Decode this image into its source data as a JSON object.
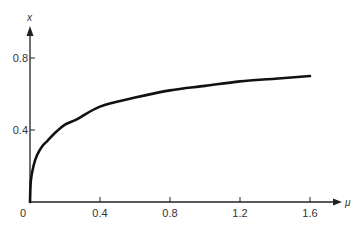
{
  "chart_data": {
    "type": "line",
    "title": "",
    "xlabel": "μ",
    "ylabel": "x",
    "xlim": [
      0,
      1.6
    ],
    "ylim": [
      0,
      0.8
    ],
    "origin_label": "0",
    "x_ticks": [
      0.4,
      0.8,
      1.2,
      1.6
    ],
    "x_tick_labels": [
      "0.4",
      "0.8",
      "1.2",
      "1.6"
    ],
    "y_ticks": [
      0.4,
      0.8
    ],
    "y_tick_labels": [
      "0.4",
      "0.8"
    ],
    "grid": false,
    "legend": "none",
    "series": [
      {
        "name": "x(μ)",
        "color": "#111111",
        "x": [
          0,
          0.005,
          0.02,
          0.04,
          0.07,
          0.1,
          0.15,
          0.2,
          0.27,
          0.4,
          0.6,
          0.8,
          1.0,
          1.2,
          1.4,
          1.6
        ],
        "y": [
          0,
          0.12,
          0.2,
          0.26,
          0.31,
          0.34,
          0.39,
          0.43,
          0.46,
          0.53,
          0.58,
          0.62,
          0.645,
          0.67,
          0.685,
          0.7
        ]
      }
    ]
  }
}
